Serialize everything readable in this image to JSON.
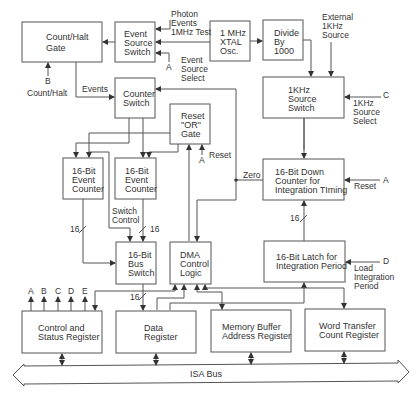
{
  "blocks": {
    "count_halt_gate": [
      "Count/Halt",
      "Gate"
    ],
    "event_source_switch": [
      "Event",
      "Source",
      "Switch"
    ],
    "xtal_osc": [
      "1 MHz",
      "XTAL",
      "Osc."
    ],
    "divide_by": [
      "Divide",
      "By",
      "1000"
    ],
    "counter_switch": [
      "Counter",
      "Switch"
    ],
    "reset_or_gate": [
      "Reset",
      "\"OR\"",
      "Gate"
    ],
    "khz_source_switch": [
      "1KHz",
      "Source",
      "Switch"
    ],
    "event_counter_1": [
      "16-Bit",
      "Event",
      "Counter"
    ],
    "event_counter_2": [
      "16-Bit",
      "Event",
      "Counter"
    ],
    "down_counter": [
      "16-Bit Down",
      "Counter for",
      "Integration TIming"
    ],
    "bus_switch": [
      "16-Bit",
      "Bus",
      "Switch"
    ],
    "dma_control": [
      "DMA",
      "Control",
      "Logic"
    ],
    "latch": [
      "16-Bit Latch for",
      "Integration Period"
    ],
    "control_status": [
      "Control and",
      "Status Register"
    ],
    "data_register": [
      "Data",
      "Register"
    ],
    "memory_buffer": [
      "Memory Buffer",
      "Address Register"
    ],
    "word_transfer": [
      "Word Transfer",
      "Count Register"
    ]
  },
  "labels": {
    "photon_events": [
      "Photon",
      "Events",
      "1MHz Test"
    ],
    "event_source_select": [
      "Event",
      "Source",
      "Select"
    ],
    "event_source_select_pin": "A",
    "external_1khz": [
      "External",
      "1KHz",
      "Source"
    ],
    "khz_select_pin": "C",
    "khz_select": [
      "1KHz",
      "Source",
      "Select"
    ],
    "count_halt_pin": "B",
    "count_halt": "Count/Halt",
    "events": "Events",
    "reset_pin": "A",
    "reset": "Reset",
    "zero": "Zero",
    "down_reset_pin": "A",
    "down_reset": "Reset",
    "bus_width_1": "16",
    "bus_width_2": "16",
    "bus_width_3": "16",
    "bus_width_4": "16",
    "switch_control": [
      "Switch",
      "Control"
    ],
    "load_pin": "D",
    "load_integration": [
      "Load",
      "Integration",
      "Period"
    ],
    "status_outputs": [
      "A",
      "B",
      "C",
      "D",
      "E"
    ],
    "isa_bus": "ISA Bus"
  }
}
